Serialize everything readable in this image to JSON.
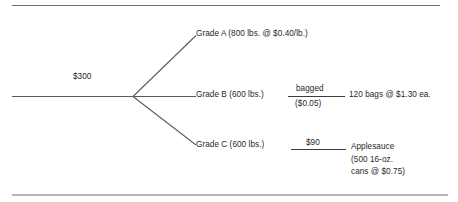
{
  "diagram": {
    "type": "decision-tree",
    "title": "",
    "root": {
      "label": "$300",
      "name": "trunk-value"
    },
    "branches": [
      {
        "id": "a",
        "label": "Grade A (800 lbs. @ $0.40/lb.)",
        "grade": "Grade A",
        "quantity": "800 lbs.",
        "unit_price": "$0.40/lb."
      },
      {
        "id": "b",
        "label": "Grade B (600 lbs.)",
        "grade": "Grade B",
        "quantity": "600 lbs.",
        "process_numerator": "bagged",
        "process_denominator": "($0.05)",
        "outcome": "120 bags @ $1.30 ea."
      },
      {
        "id": "c",
        "label": "Grade C (600 lbs.)",
        "grade": "Grade C",
        "quantity": "600 lbs.",
        "process_cost": "$90",
        "outcome_line1": "Applesauce",
        "outcome_line2": "(500 16-oz.",
        "outcome_line3": "cans @ $0.75)"
      }
    ],
    "colors": {
      "line": "#5a5a5a",
      "rule": "#4d4d4d",
      "text": "#1f1f1f",
      "background": "#ffffff"
    }
  }
}
